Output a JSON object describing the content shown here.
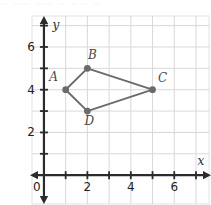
{
  "figure": {
    "background_color": "#ffffff",
    "plot_background_color": "#ffffff",
    "top_artifact_text": "— —— —— — —— —"
  },
  "chart_data": {
    "type": "scatter",
    "title": "",
    "subtitle": "",
    "xlabel": "x",
    "ylabel": "y",
    "xlim": [
      -0.55,
      7.6
    ],
    "ylim": [
      -1.35,
      7.45
    ],
    "grid": true,
    "grid_color": "#d8d8dc",
    "axis_color": "#2b2b2b",
    "origin_label": "0",
    "xticks": [
      1,
      2,
      3,
      4,
      5,
      6,
      7
    ],
    "yticks": [
      1,
      2,
      3,
      4,
      5,
      6,
      7
    ],
    "xtick_labels": [
      {
        "value": 2,
        "text": "2"
      },
      {
        "value": 4,
        "text": "4"
      },
      {
        "value": 6,
        "text": "6"
      }
    ],
    "ytick_labels": [
      {
        "value": 2,
        "text": "2"
      },
      {
        "value": 4,
        "text": "4"
      },
      {
        "value": 6,
        "text": "6"
      }
    ],
    "series": [
      {
        "name": "Quadrilateral ABCD",
        "shape": "closed-polygon",
        "marker_color": "#6b6b6b",
        "line_color": "#6b6b6b",
        "points": [
          {
            "label": "A",
            "x": 1,
            "y": 4,
            "label_dx": -12,
            "label_dy": -9
          },
          {
            "label": "B",
            "x": 2,
            "y": 5,
            "label_dx": 5,
            "label_dy": -9
          },
          {
            "label": "C",
            "x": 5,
            "y": 4,
            "label_dx": 10,
            "label_dy": -8
          },
          {
            "label": "D",
            "x": 2,
            "y": 3,
            "label_dx": 2,
            "label_dy": 14
          }
        ]
      }
    ],
    "annotations": []
  }
}
